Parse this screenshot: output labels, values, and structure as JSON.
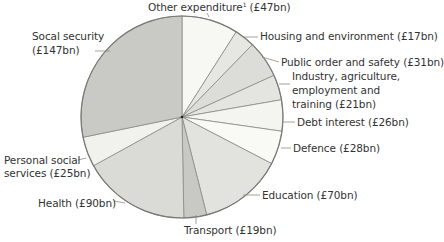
{
  "chart_data": {
    "type": "pie",
    "title": "",
    "unit": "£bn",
    "start_angle": "12 o'clock",
    "direction": "clockwise",
    "slices": [
      {
        "label": "Other expenditure",
        "footnote": "1",
        "value": 47,
        "color": "#f7f7f3"
      },
      {
        "label": "Housing and environment",
        "value": 17,
        "color": "#e6e6e2"
      },
      {
        "label": "Public order and safety",
        "value": 31,
        "color": "#dcdcd8"
      },
      {
        "label": "Industry, agriculture, employment and training",
        "value": 21,
        "color": "#e4e4e0"
      },
      {
        "label": "Debt interest",
        "value": 26,
        "color": "#f4f4f0"
      },
      {
        "label": "Defence",
        "value": 28,
        "color": "#f9f9f6"
      },
      {
        "label": "Education",
        "value": 70,
        "color": "#e2e2de"
      },
      {
        "label": "Transport",
        "value": 19,
        "color": "#c8c8c4"
      },
      {
        "label": "Health",
        "value": 90,
        "color": "#dadad6"
      },
      {
        "label": "Personal social services",
        "value": 25,
        "color": "#f1f1ed"
      },
      {
        "label": "Social security",
        "value": 147,
        "color": "#c9c9c5"
      }
    ],
    "total": 521
  },
  "labels": {
    "other": {
      "text": "Other expenditure",
      "sup": "1",
      "value": "(£47bn)"
    },
    "housing": "Housing and environment (£17bn)",
    "public_order": "Public order and safety (£31bn)",
    "industry_l1": "Industry, agriculture,",
    "industry_l2": "employment and",
    "industry_l3": "training (£21bn)",
    "debt": "Debt interest (£26bn)",
    "defence": "Defence (£28bn)",
    "education": "Education (£70bn)",
    "transport": "Transport (£19bn)",
    "health": "Health (£90bn)",
    "pss_l1": "Personal social",
    "pss_l2": "services (£25bn)",
    "social_l1": "Socal security",
    "social_l2": "(£147bn)"
  },
  "style": {
    "stroke": "#8a8a86",
    "outline": "#7a7a76",
    "leader": "#8a8a86"
  }
}
